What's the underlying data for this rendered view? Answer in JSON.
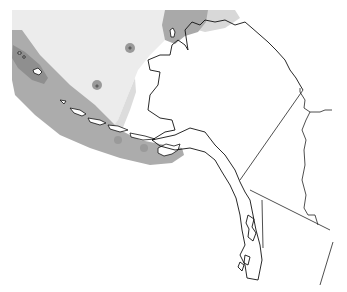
{
  "map": {
    "region": "Alaska and Bering Sea",
    "labels": [],
    "colors": {
      "background": "#ffffff",
      "zone_light": "#ececec",
      "zone_medium": "#d6d6d6",
      "zone_dark": "#a9a9a9",
      "zone_darker": "#8f8f8f",
      "coastline": "#111111"
    },
    "zones": [
      {
        "name": "light-sea-zone",
        "shade": "zone_light"
      },
      {
        "name": "medium-sea-zone",
        "shade": "zone_medium"
      },
      {
        "name": "aleutian-dark-zone",
        "shade": "zone_dark"
      },
      {
        "name": "north-dark-zone",
        "shade": "zone_dark"
      }
    ]
  }
}
